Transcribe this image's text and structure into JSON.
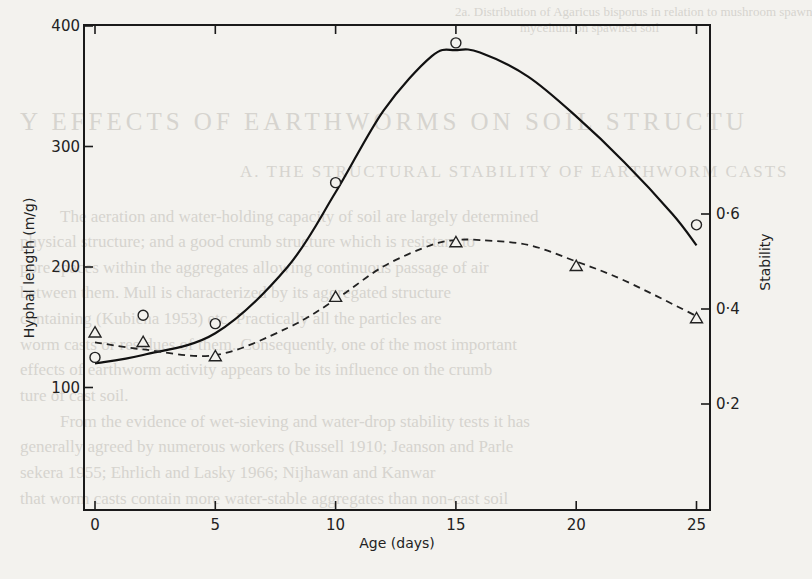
{
  "page": {
    "background_color": "#f3f2ee",
    "ink_color": "#1a1a1a",
    "bleed_through_text": [
      {
        "cls": "cap",
        "x": 455,
        "y": 4,
        "text": "2a. Distribution of Agaricus bisporus in relation to mushroom spawn"
      },
      {
        "cls": "cap",
        "x": 520,
        "y": 20,
        "text": "mycelium on spawned soil"
      },
      {
        "cls": "head",
        "x": 20,
        "y": 108,
        "text": "Y EFFECTS OF EARTHWORMS ON SOIL STRUCTU"
      },
      {
        "cls": "sub",
        "x": 240,
        "y": 162,
        "text": "A. THE STRUCTURAL STABILITY OF EARTHWORM CASTS"
      },
      {
        "cls": "body",
        "x": 60,
        "y": 207,
        "text": "The aeration and water-holding capacity of soil are largely determined"
      },
      {
        "cls": "body",
        "x": 20,
        "y": 232,
        "text": "physical structure; and a good crumb structure which is resistant to"
      },
      {
        "cls": "body",
        "x": 20,
        "y": 258,
        "text": "pore spaces within the aggregates allowing continuous passage of air"
      },
      {
        "cls": "body",
        "x": 20,
        "y": 283,
        "text": "between them. Mull is characterized by its aggregated structure"
      },
      {
        "cls": "body",
        "x": 20,
        "y": 309,
        "text": "containing (Kubiena 1953) etc. Practically all the particles are"
      },
      {
        "cls": "body",
        "x": 20,
        "y": 335,
        "text": "worm casts or residues of them. Consequently, one of the most important"
      },
      {
        "cls": "body",
        "x": 20,
        "y": 360,
        "text": "effects of earthworm activity appears to be its influence on the crumb"
      },
      {
        "cls": "body",
        "x": 20,
        "y": 386,
        "text": "ture of cast soil."
      },
      {
        "cls": "body",
        "x": 60,
        "y": 412,
        "text": "From the evidence of wet-sieving and water-drop stability tests it has"
      },
      {
        "cls": "body",
        "x": 20,
        "y": 437,
        "text": "generally agreed by numerous workers (Russell 1910; Jeanson and Parle"
      },
      {
        "cls": "body",
        "x": 20,
        "y": 463,
        "text": "sekera 1955; Ehrlich and Lasky 1966; Nijhawan and Kanwar"
      },
      {
        "cls": "body",
        "x": 20,
        "y": 489,
        "text": "that worm casts contain more water-stable aggregates than non-cast soil"
      }
    ]
  },
  "chart_data": {
    "type": "line",
    "title": "",
    "xlabel": "Age (days)",
    "ylabel": "Hyphal length (m/g)",
    "y2label": "Stability",
    "xlim": [
      -0.5,
      25.6
    ],
    "ylim": [
      0,
      400
    ],
    "y2lim": [
      0.0,
      0.6
    ],
    "x_ticks": [
      0,
      5,
      10,
      15,
      20,
      25
    ],
    "x_tick_labels": [
      "0",
      "5",
      "10",
      "15",
      "20",
      "25"
    ],
    "y_ticks": [
      100,
      200,
      300,
      400
    ],
    "y_tick_labels": [
      "100",
      "200",
      "300",
      "400"
    ],
    "y2_ticks": [
      0.2,
      0.4,
      0.6
    ],
    "y2_tick_labels": [
      "0·2",
      "0·4",
      "0·6"
    ],
    "grid": false,
    "legend": null,
    "series": [
      {
        "name": "Hyphal length",
        "axis": "left",
        "marker": "circle",
        "line_style": "solid",
        "x": [
          0,
          2,
          5,
          10,
          15,
          25
        ],
        "values": [
          125,
          160,
          153,
          270,
          386,
          235
        ],
        "fitted_curve": {
          "x": [
            0,
            2,
            5,
            8,
            10,
            12,
            14,
            15,
            16,
            18,
            20,
            22,
            24,
            25
          ],
          "values": [
            120,
            127,
            145,
            200,
            262,
            330,
            375,
            380,
            378,
            358,
            325,
            287,
            244,
            218
          ]
        }
      },
      {
        "name": "Stability",
        "axis": "right",
        "marker": "triangle",
        "line_style": "dashed",
        "x": [
          0,
          2,
          5,
          10,
          15,
          20,
          25
        ],
        "values": [
          0.35,
          0.33,
          0.3,
          0.425,
          0.54,
          0.49,
          0.38
        ],
        "fitted_curve": {
          "x": [
            0,
            2,
            5,
            8,
            10,
            12,
            14,
            15,
            16,
            18,
            20,
            22,
            25
          ],
          "values": [
            0.33,
            0.315,
            0.303,
            0.36,
            0.42,
            0.49,
            0.535,
            0.545,
            0.545,
            0.535,
            0.5,
            0.46,
            0.385
          ]
        }
      }
    ]
  }
}
